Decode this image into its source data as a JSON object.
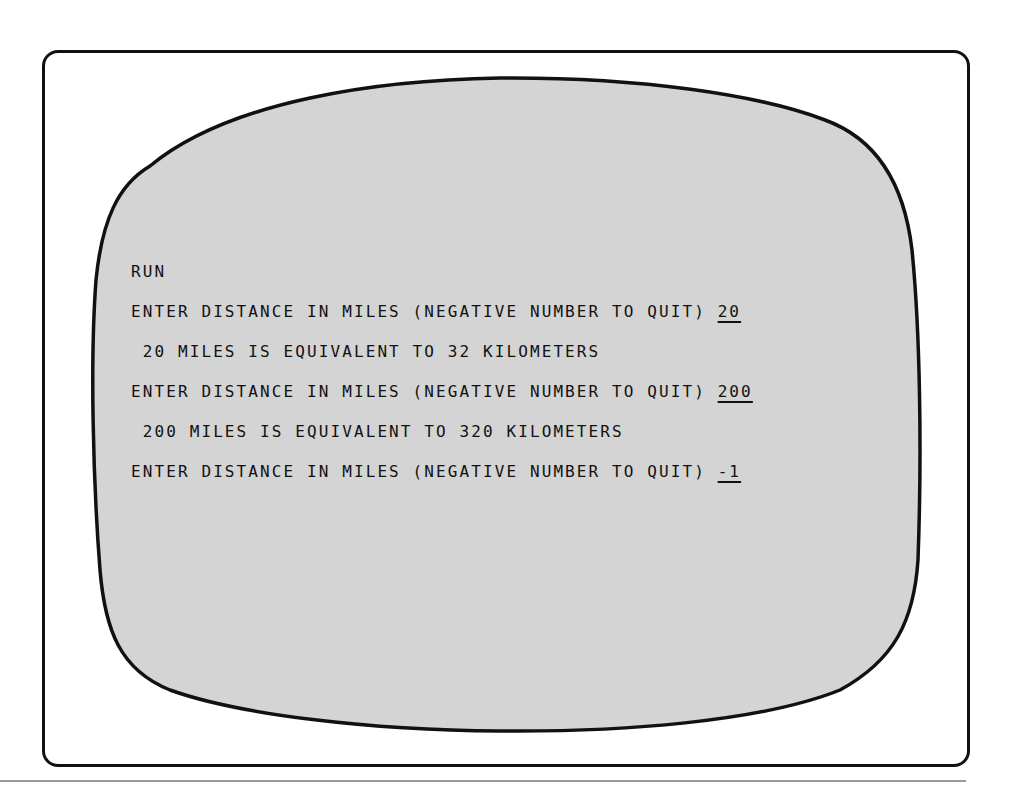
{
  "screen": {
    "background_color": "#d4d4d4",
    "border_color": "#111111",
    "lines": [
      {
        "text": "RUN",
        "input": ""
      },
      {
        "text": "ENTER DISTANCE IN MILES (NEGATIVE NUMBER TO QUIT) ",
        "input": "20"
      },
      {
        "text": " 20 MILES IS EQUIVALENT TO 32 KILOMETERS",
        "input": ""
      },
      {
        "text": "ENTER DISTANCE IN MILES (NEGATIVE NUMBER TO QUIT) ",
        "input": "200"
      },
      {
        "text": " 200 MILES IS EQUIVALENT TO 320 KILOMETERS",
        "input": ""
      },
      {
        "text": "ENTER DISTANCE IN MILES (NEGATIVE NUMBER TO QUIT) ",
        "input": "-1"
      }
    ]
  }
}
